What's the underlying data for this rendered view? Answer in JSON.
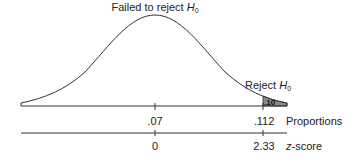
{
  "diagram": {
    "type": "normal-distribution-hypothesis-test",
    "top_label": {
      "text": "Failed to reject ",
      "symbol": "H",
      "subscript": "0"
    },
    "reject_label": {
      "text": "Reject ",
      "symbol": "H",
      "subscript": "0"
    },
    "shaded_area_label": ".10",
    "proportions_axis": {
      "name": "Proportions",
      "ticks": [
        ".07",
        ".112"
      ]
    },
    "zscore_axis": {
      "name_italic": "z",
      "name_rest": "-score",
      "ticks": [
        "0",
        "2.33"
      ]
    },
    "colors": {
      "curve": "#333333",
      "shaded_region": "#8a8a8a",
      "axis": "#333333"
    }
  }
}
